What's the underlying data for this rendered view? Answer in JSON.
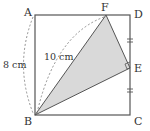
{
  "diagram": {
    "type": "geometry-square",
    "points": {
      "A": {
        "label": "A",
        "x": 35,
        "y": 15
      },
      "B": {
        "label": "B",
        "x": 35,
        "y": 115
      },
      "C": {
        "label": "C",
        "x": 130,
        "y": 115
      },
      "D": {
        "label": "D",
        "x": 130,
        "y": 15
      },
      "E": {
        "label": "E",
        "x": 130,
        "y": 68
      },
      "F": {
        "label": "F",
        "x": 106,
        "y": 15
      }
    },
    "measurements": {
      "ab_length": "8 cm",
      "bf_length": "10 cm"
    },
    "shaded_triangle": "BFE",
    "right_angle_at": "E",
    "equal_marks": [
      "DE",
      "EC"
    ],
    "colors": {
      "stroke": "#555555",
      "fill_shaded": "#d9d9d9",
      "dashed": "#777777",
      "text": "#333333"
    }
  }
}
